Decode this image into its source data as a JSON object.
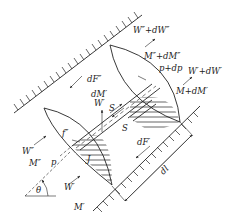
{
  "figure": {
    "labels": {
      "w2_plus_dw2": "W″+dW″",
      "m2_plus_dm2": "M″+dM″",
      "p_plus_dp": "p+dp",
      "w1_plus_dw1": "W′+dW′",
      "m1_plus_dm1": "M+dM′",
      "df2": "dF″",
      "dm1": "dM′",
      "w1_mid": "W′",
      "s_top": "S",
      "s_bottom": "S",
      "f2": "f″",
      "w2": "W″",
      "m2": "M″",
      "p": "p",
      "j": "J",
      "w1": "W′",
      "m1": "M′",
      "df1": "dF′",
      "dl": "dl",
      "theta": "θ"
    }
  }
}
